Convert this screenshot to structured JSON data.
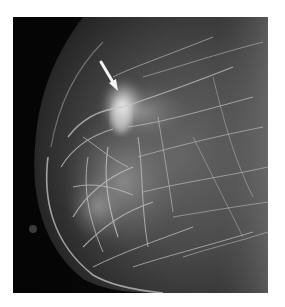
{
  "image": {
    "type": "mammogram",
    "view": "breast tissue X-ray, left-facing",
    "background_color": "#ffffff",
    "frame_color": "#050505",
    "tissue_tone": "#8a8a8a",
    "highlight_tone": "#f2f2f2"
  },
  "annotation": {
    "type": "arrow",
    "color": "#f5f5f5",
    "points_to": "dense spiculated region (upper central breast)"
  }
}
